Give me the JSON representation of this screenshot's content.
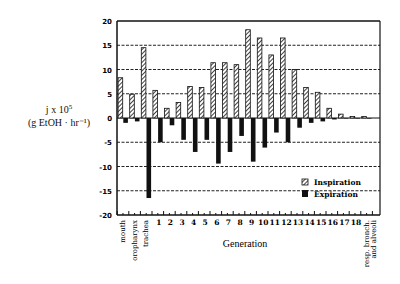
{
  "chart_data": {
    "type": "bar",
    "title": "",
    "xlabel": "Generation",
    "ylabel": "j x 10^5 (g EtOH · hr⁻¹)",
    "ylabel_line1": "j x 10",
    "ylabel_sup": "5",
    "ylabel_line2": "(g EtOH · hr⁻¹)",
    "ylim": [
      -20,
      20
    ],
    "yticks": [
      20,
      15,
      10,
      5,
      0,
      -5,
      -10,
      -15,
      -20
    ],
    "grid": "horizontal dashed",
    "legend_position": "lower right inside",
    "categories": [
      "mouth",
      "oropharynx",
      "trachea",
      "1",
      "2",
      "3",
      "4",
      "5",
      "6",
      "7",
      "8",
      "9",
      "10",
      "11",
      "12",
      "13",
      "14",
      "15",
      "16",
      "17",
      "18",
      "resp. bronch. and alveoli"
    ],
    "series": [
      {
        "name": "Inspiration",
        "pattern": "hatched",
        "values": [
          8.3,
          4.9,
          14.5,
          5.7,
          2.0,
          3.2,
          6.5,
          6.3,
          11.4,
          11.4,
          11.0,
          18.2,
          16.5,
          13.0,
          16.5,
          10.0,
          6.3,
          5.3,
          2.0,
          0.8,
          0.3,
          0.3
        ]
      },
      {
        "name": "Expiration",
        "pattern": "solid",
        "values": [
          -1.0,
          -0.7,
          -16.5,
          -5.0,
          -1.5,
          -4.5,
          -7.0,
          -4.5,
          -9.4,
          -7.0,
          -3.7,
          -9.0,
          -6.1,
          -3.0,
          -5.0,
          -2.0,
          -1.0,
          -0.7,
          -0.3,
          -0.1,
          -0.1,
          -0.1
        ]
      }
    ]
  }
}
